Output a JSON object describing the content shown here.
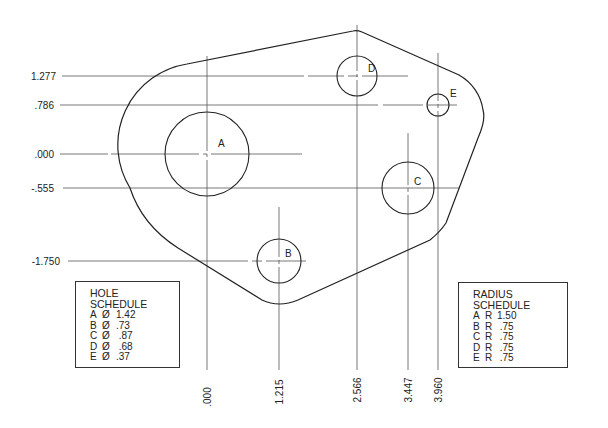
{
  "drawing": {
    "x_dimensions": [
      {
        "id": "x0",
        "label": ".000"
      },
      {
        "id": "x1",
        "label": "1.215"
      },
      {
        "id": "x2",
        "label": "2.566"
      },
      {
        "id": "x3",
        "label": "3.447"
      },
      {
        "id": "x4",
        "label": "3.960"
      }
    ],
    "y_dimensions": [
      {
        "id": "y0",
        "label": "1.277"
      },
      {
        "id": "y1",
        "label": ".786"
      },
      {
        "id": "y2",
        "label": ".000"
      },
      {
        "id": "y3",
        "label": "-.555"
      },
      {
        "id": "y4",
        "label": "-1.750"
      }
    ],
    "holes": [
      {
        "letter": "A"
      },
      {
        "letter": "B"
      },
      {
        "letter": "C"
      },
      {
        "letter": "D"
      },
      {
        "letter": "E"
      }
    ]
  },
  "hole_schedule": {
    "title": "HOLE SCHEDULE",
    "rows": [
      {
        "letter": "A",
        "symbol": "Ø",
        "value": "1.42"
      },
      {
        "letter": "B",
        "symbol": "Ø",
        "value": ".73"
      },
      {
        "letter": "C",
        "symbol": "Ø",
        "value": " .87"
      },
      {
        "letter": "D",
        "symbol": "Ø",
        "value": " .68"
      },
      {
        "letter": "E",
        "symbol": "Ø",
        "value": ".37"
      }
    ]
  },
  "radius_schedule": {
    "title": "RADIUS SCHEDULE",
    "rows": [
      {
        "letter": "A",
        "symbol": "R",
        "value": "1.50"
      },
      {
        "letter": "B",
        "symbol": "R",
        "value": " .75"
      },
      {
        "letter": "C",
        "symbol": "R",
        "value": " .75"
      },
      {
        "letter": "D",
        "symbol": "R",
        "value": " .75"
      },
      {
        "letter": "E",
        "symbol": "R",
        "value": " .75"
      }
    ]
  }
}
